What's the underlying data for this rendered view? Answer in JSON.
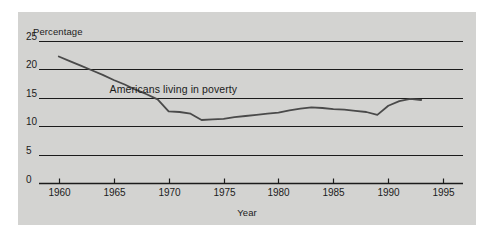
{
  "figure": {
    "background_color": "#ffffff",
    "panel_color": "#d3d3d1",
    "ink_color": "#1b1b1b"
  },
  "chart_data": {
    "type": "line",
    "title": "",
    "xlabel": "Year",
    "ylabel": "Percentage",
    "xlim": [
      1958.2,
      1996.8
    ],
    "ylim": [
      0,
      26.5
    ],
    "grid": true,
    "grid_orientation": "horizontal",
    "legend_position": "inline-annotation",
    "yticks": [
      0,
      5,
      10,
      15,
      20,
      25
    ],
    "ytick_labels": [
      "0",
      "5",
      "10",
      "15",
      "20",
      "25"
    ],
    "xticks": [
      1960,
      1965,
      1970,
      1975,
      1980,
      1985,
      1990,
      1995
    ],
    "xtick_labels": [
      "1960",
      "1965",
      "1970",
      "1975",
      "1980",
      "1985",
      "1990",
      "1995"
    ],
    "annotations": [
      {
        "text": "Americans living in poverty",
        "x": 1971,
        "y": 16.4
      }
    ],
    "series": [
      {
        "name": "Americans living in poverty",
        "color": "#4a4a4a",
        "x": [
          1960,
          1961,
          1962,
          1963,
          1964,
          1965,
          1966,
          1967,
          1968,
          1969,
          1970,
          1971,
          1972,
          1973,
          1974,
          1975,
          1976,
          1977,
          1978,
          1979,
          1980,
          1981,
          1982,
          1983,
          1984,
          1985,
          1986,
          1987,
          1988,
          1989,
          1990,
          1991,
          1992,
          1993
        ],
        "values": [
          22.2,
          21.4,
          20.6,
          19.8,
          19.0,
          18.1,
          17.3,
          16.4,
          15.6,
          14.7,
          12.6,
          12.5,
          12.2,
          11.1,
          11.2,
          11.3,
          11.6,
          11.8,
          12.0,
          12.2,
          12.4,
          12.8,
          13.1,
          13.3,
          13.2,
          13.0,
          12.9,
          12.7,
          12.5,
          12.0,
          13.6,
          14.4,
          14.8,
          14.6
        ]
      }
    ]
  }
}
